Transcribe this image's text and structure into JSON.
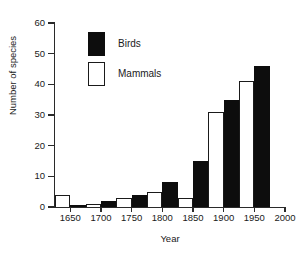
{
  "chart_data": {
    "type": "bar",
    "title": "",
    "subtitle": "",
    "xlabel": "Year",
    "ylabel": "Number of species",
    "xlim": [
      1625,
      2000
    ],
    "ylim": [
      0,
      60
    ],
    "ytick_labels": [
      "0",
      "10",
      "20",
      "30",
      "40",
      "50",
      "60"
    ],
    "ytick_values": [
      0,
      10,
      20,
      30,
      40,
      50,
      60
    ],
    "xtick_labels": [
      "1650",
      "1700",
      "1750",
      "1800",
      "1850",
      "1900",
      "1950",
      "2000"
    ],
    "xtick_values": [
      1650,
      1700,
      1750,
      1800,
      1850,
      1900,
      1950,
      2000
    ],
    "grid": false,
    "legend_position": "upper-left-inside",
    "bar_interval_years": 25,
    "legend": [
      {
        "name": "Birds",
        "color": "#0d0d0d",
        "fill": "solid"
      },
      {
        "name": "Mammals",
        "color": "#ffffff",
        "fill": "outline"
      }
    ],
    "series": [
      {
        "name": "Mammals",
        "color": "#ffffff",
        "fill": "outline",
        "bins": [
          {
            "start": 1625,
            "end": 1650,
            "value": 4
          },
          {
            "start": 1675,
            "end": 1700,
            "value": 1
          },
          {
            "start": 1725,
            "end": 1750,
            "value": 3
          },
          {
            "start": 1775,
            "end": 1800,
            "value": 5
          },
          {
            "start": 1825,
            "end": 1850,
            "value": 3
          },
          {
            "start": 1875,
            "end": 1900,
            "value": 31
          },
          {
            "start": 1925,
            "end": 1950,
            "value": 41
          }
        ]
      },
      {
        "name": "Birds",
        "color": "#0d0d0d",
        "fill": "solid",
        "bins": [
          {
            "start": 1650,
            "end": 1675,
            "value": 0
          },
          {
            "start": 1700,
            "end": 1725,
            "value": 2
          },
          {
            "start": 1750,
            "end": 1775,
            "value": 4
          },
          {
            "start": 1800,
            "end": 1825,
            "value": 8
          },
          {
            "start": 1850,
            "end": 1875,
            "value": 15
          },
          {
            "start": 1900,
            "end": 1925,
            "value": 35
          },
          {
            "start": 1950,
            "end": 1975,
            "value": 46
          }
        ]
      }
    ]
  }
}
